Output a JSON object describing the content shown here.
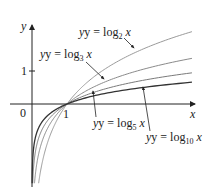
{
  "chart_data": {
    "type": "line",
    "title": "",
    "xlabel": "x",
    "ylabel": "y",
    "xlim": [
      -0.6,
      4.7
    ],
    "ylim": [
      -2.4,
      2.4
    ],
    "grid": false,
    "legend": "inline labels with arrows",
    "x_ticks": [
      {
        "value": 1,
        "label": "1"
      }
    ],
    "y_ticks": [
      {
        "value": 1,
        "label": "1"
      }
    ],
    "origin_label": "0",
    "series": [
      {
        "name": "y = log2 x",
        "base": 2,
        "color": "#9a9a9a",
        "label": {
          "prefix": "y = log",
          "sub": "2",
          "suffix": " x"
        },
        "points": [
          [
            0.19,
            -2.4
          ],
          [
            0.25,
            -2.0
          ],
          [
            0.5,
            -1.0
          ],
          [
            1,
            0
          ],
          [
            2,
            1.0
          ],
          [
            3,
            1.585
          ],
          [
            4,
            2.0
          ],
          [
            4.57,
            2.19
          ]
        ]
      },
      {
        "name": "y = log3 x",
        "base": 3,
        "color": "#8a8a8a",
        "label": {
          "prefix": "y = log",
          "sub": "3",
          "suffix": " x"
        },
        "points": [
          [
            0.07,
            -2.4
          ],
          [
            0.111,
            -2.0
          ],
          [
            0.333,
            -1.0
          ],
          [
            1,
            0
          ],
          [
            2,
            0.631
          ],
          [
            3,
            1.0
          ],
          [
            4,
            1.262
          ],
          [
            4.57,
            1.383
          ]
        ]
      },
      {
        "name": "y = log5 x",
        "base": 5,
        "color": "#7a7a7a",
        "label": {
          "prefix": "y = log",
          "sub": "5",
          "suffix": " x"
        },
        "points": [
          [
            0.021,
            -2.4
          ],
          [
            0.04,
            -2.0
          ],
          [
            0.2,
            -1.0
          ],
          [
            1,
            0
          ],
          [
            2,
            0.431
          ],
          [
            3,
            0.683
          ],
          [
            4,
            0.861
          ],
          [
            4.57,
            0.944
          ]
        ]
      },
      {
        "name": "y = log10 x",
        "base": 10,
        "color": "#333333",
        "label": {
          "prefix": "y = log",
          "sub": "10",
          "suffix": " x"
        },
        "points": [
          [
            0.004,
            -2.4
          ],
          [
            0.01,
            -2.0
          ],
          [
            0.1,
            -1.0
          ],
          [
            1,
            0
          ],
          [
            2,
            0.301
          ],
          [
            3,
            0.477
          ],
          [
            4,
            0.602
          ],
          [
            4.57,
            0.66
          ]
        ]
      }
    ]
  },
  "labels": {
    "x_axis": "x",
    "y_axis": "y",
    "origin": "0",
    "x_tick_1": "1",
    "y_tick_1": "1",
    "log2": {
      "prefix": "y = log",
      "sub": "2",
      "suffix": " x"
    },
    "log3": {
      "prefix": "y = log",
      "sub": "3",
      "suffix": " x"
    },
    "log5": {
      "prefix": "y = log",
      "sub": "5",
      "suffix": " x"
    },
    "log10": {
      "prefix": "y = log",
      "sub": "10",
      "suffix": " x"
    }
  }
}
